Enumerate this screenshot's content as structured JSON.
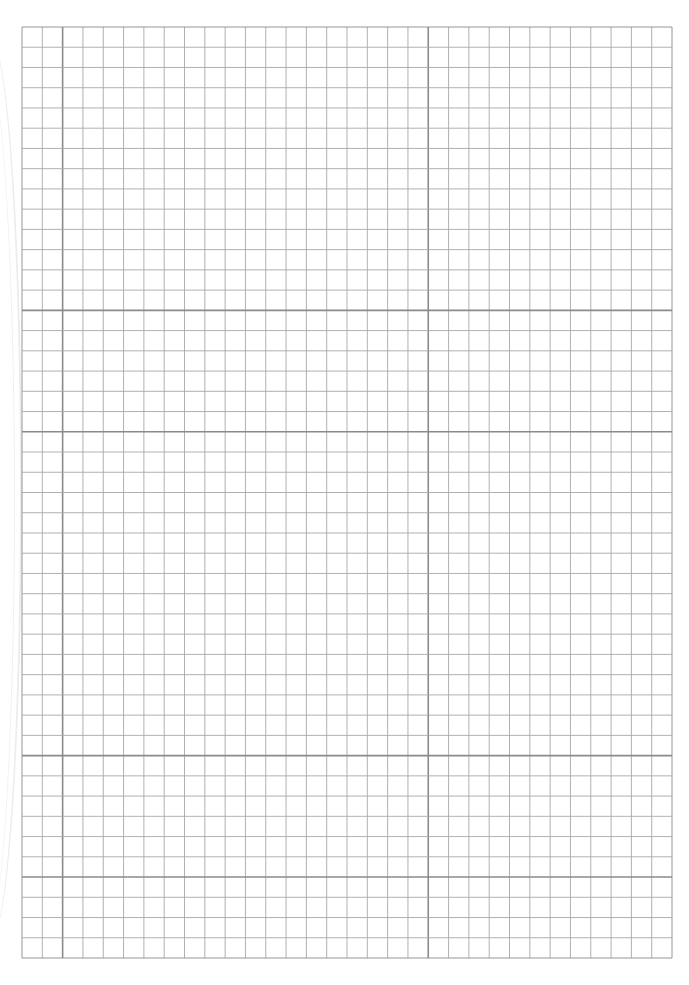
{
  "sheet": {
    "type": "graph paper",
    "grid": {
      "left": 22,
      "top": 27,
      "right": 672,
      "bottom": 958,
      "columns": 32,
      "rows": 46,
      "line_color": "#a8a8a8",
      "major_line_color": "#8a8a8a",
      "major_vertical_indices": [
        2,
        20
      ],
      "major_horizontal_indices": [
        14,
        20,
        36,
        42
      ]
    }
  }
}
